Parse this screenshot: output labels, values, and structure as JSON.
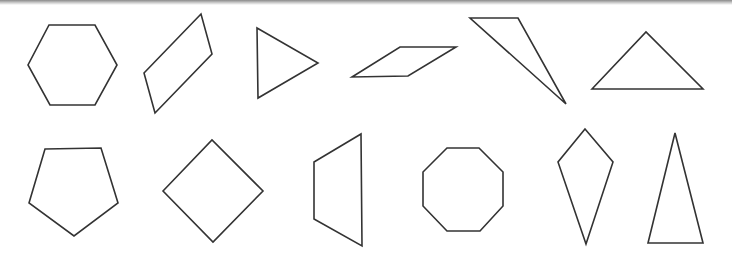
{
  "canvas": {
    "width": 732,
    "height": 260,
    "background": "#ffffff",
    "stroke": "#333333"
  },
  "shapes": [
    {
      "name": "hexagon",
      "row": 1,
      "points": "49,25 95,25 117,65 95,105 50,105 28,65"
    },
    {
      "name": "parallelogram",
      "row": 1,
      "points": "144,73 201,14 212,54 155,113"
    },
    {
      "name": "triangle-right-pointing",
      "row": 1,
      "points": "257,28 318,63 258,98"
    },
    {
      "name": "rhombus-flat",
      "row": 1,
      "points": "352,77 400,47 456,47 408,76"
    },
    {
      "name": "obtuse-triangle",
      "row": 1,
      "points": "470,18 518,18 566,104"
    },
    {
      "name": "triangle",
      "row": 1,
      "points": "592,89 646,32 703,89"
    },
    {
      "name": "pentagon",
      "row": 2,
      "points": "45,149 101,148 118,203 74,236 29,203"
    },
    {
      "name": "square-rotated",
      "row": 2,
      "points": "163,191 212,140 263,191 213,242"
    },
    {
      "name": "trapezoid",
      "row": 2,
      "points": "314,162 361,134 362,246 314,219"
    },
    {
      "name": "octagon",
      "row": 2,
      "points": "447,148 479,148 503,172 503,206 480,231 447,231 423,206 423,172"
    },
    {
      "name": "kite",
      "row": 2,
      "points": "585,129 613,162 586,244 558,162"
    },
    {
      "name": "isosceles-triangle-tall",
      "row": 2,
      "points": "675,133 703,243 648,243"
    }
  ]
}
